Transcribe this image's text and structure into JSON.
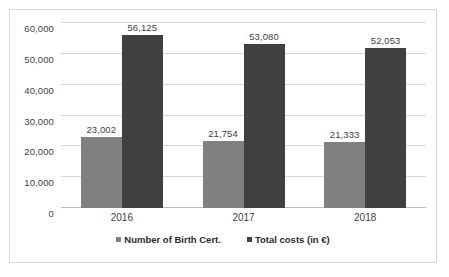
{
  "chart_data": {
    "type": "bar",
    "title": "",
    "subtitle": "",
    "xlabel": "",
    "ylabel": "",
    "categories": [
      "2016",
      "2017",
      "2018"
    ],
    "series": [
      {
        "name": "Number of Birth Cert.",
        "color": "#808080",
        "values": [
          23002,
          21754,
          21333
        ],
        "labels": [
          "23,002",
          "21,754",
          "21,333"
        ]
      },
      {
        "name": "Total costs (in €)",
        "color": "#404040",
        "values": [
          56125,
          53080,
          52053
        ],
        "labels": [
          "56,125",
          "53,080",
          "52,053"
        ]
      }
    ],
    "ylim": [
      0,
      60000
    ],
    "ytick_values": [
      0,
      10000,
      20000,
      30000,
      40000,
      50000,
      60000
    ],
    "ytick_labels": [
      "0",
      "10,000",
      "20,000",
      "30,000",
      "40,000",
      "50,000",
      "60,000"
    ],
    "grid": true,
    "legend_position": "bottom",
    "annotations": []
  }
}
